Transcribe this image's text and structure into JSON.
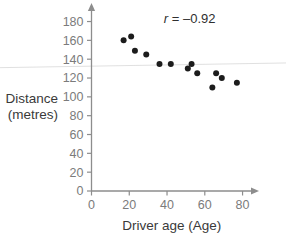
{
  "chart_data": {
    "type": "scatter",
    "title": "",
    "subtitle": "",
    "xlabel": "Driver age (Age)",
    "ylabel": "Distance (metres)",
    "ylabel_lines": [
      "Distance",
      "(metres)"
    ],
    "xlim": [
      0,
      85
    ],
    "ylim": [
      0,
      188
    ],
    "xticks": [
      0,
      20,
      40,
      60,
      80
    ],
    "yticks": [
      0,
      20,
      40,
      60,
      80,
      100,
      120,
      140,
      160,
      180
    ],
    "xtick_labels": [
      "0",
      "20",
      "40",
      "60",
      "80"
    ],
    "ytick_labels": [
      "0",
      "20",
      "40",
      "60",
      "80",
      "100",
      "120",
      "140",
      "160",
      "180"
    ],
    "grid": false,
    "legend": false,
    "legend_position": "none",
    "annotations": [
      {
        "name": "correlation-coefficient",
        "symbol": "r",
        "equals": " = ",
        "value": "–0.92",
        "full_text": "r = –0.92",
        "x_data": 52,
        "y_data": 178
      }
    ],
    "marker": {
      "shape": "circle",
      "color": "#1c1c1c",
      "size_px": 3.0
    },
    "axis_color": "#8d8d8d",
    "tick_label_color": "#7b7b7b",
    "axis_title_color": "#3a3a3a",
    "arrows": {
      "x_axis_arrow": true,
      "y_axis_arrow": true
    },
    "points": [
      {
        "x": 17,
        "y": 160
      },
      {
        "x": 21,
        "y": 164
      },
      {
        "x": 23,
        "y": 149
      },
      {
        "x": 29,
        "y": 145
      },
      {
        "x": 36,
        "y": 135
      },
      {
        "x": 42,
        "y": 135
      },
      {
        "x": 51,
        "y": 130
      },
      {
        "x": 53,
        "y": 135
      },
      {
        "x": 56,
        "y": 125
      },
      {
        "x": 64,
        "y": 110
      },
      {
        "x": 66,
        "y": 125
      },
      {
        "x": 69,
        "y": 120
      },
      {
        "x": 77,
        "y": 115
      }
    ],
    "point_count": 13,
    "correlation": -0.92,
    "faint_rule": {
      "present": true,
      "color": "#dcdcdc",
      "y_left_data": 131,
      "y_right_data": 136,
      "note": "faint scan artifact line across figure"
    }
  }
}
